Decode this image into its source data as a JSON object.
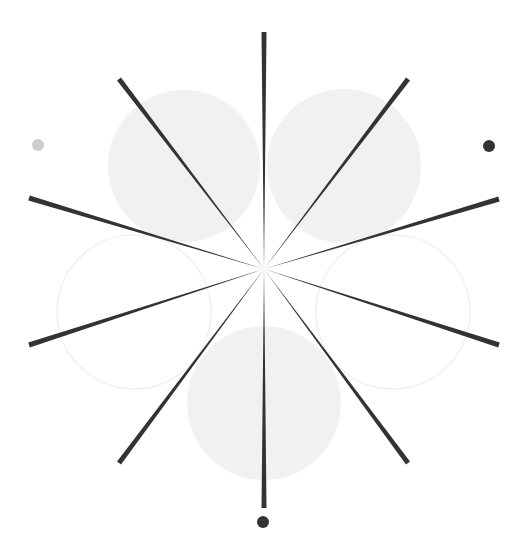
{
  "diagram": {
    "width": 529,
    "height": 551,
    "background": "#ffffff",
    "center": {
      "x": 264,
      "y": 269
    },
    "colors": {
      "spoke": "#333333",
      "filled_circle": "#f1f1f1",
      "outline_circle_stroke": "#ececec",
      "dark_dot": "#333333",
      "light_dot": "#cccccc"
    },
    "spoke_tip_width": 5,
    "spokes": [
      {
        "name": "spoke-top",
        "x": 264,
        "y": 32
      },
      {
        "name": "spoke-upper-right",
        "x": 408,
        "y": 79
      },
      {
        "name": "spoke-right-upper",
        "x": 499,
        "y": 199
      },
      {
        "name": "spoke-right-lower",
        "x": 499,
        "y": 345
      },
      {
        "name": "spoke-lower-right",
        "x": 408,
        "y": 463
      },
      {
        "name": "spoke-bottom",
        "x": 264,
        "y": 508
      },
      {
        "name": "spoke-lower-left",
        "x": 119,
        "y": 463
      },
      {
        "name": "spoke-left-lower",
        "x": 29,
        "y": 345
      },
      {
        "name": "spoke-left-upper",
        "x": 29,
        "y": 198
      },
      {
        "name": "spoke-upper-left",
        "x": 119,
        "y": 79
      }
    ],
    "circles": [
      {
        "name": "circle-upper-left",
        "cx": 184,
        "cy": 166,
        "r": 76,
        "style": "filled"
      },
      {
        "name": "circle-upper-right",
        "cx": 344,
        "cy": 166,
        "r": 77,
        "style": "filled"
      },
      {
        "name": "circle-bottom",
        "cx": 264,
        "cy": 403,
        "r": 77,
        "style": "filled"
      },
      {
        "name": "circle-left",
        "cx": 134,
        "cy": 312,
        "r": 77,
        "style": "outline"
      },
      {
        "name": "circle-right",
        "cx": 393,
        "cy": 312,
        "r": 77,
        "style": "outline"
      }
    ],
    "dots": [
      {
        "name": "dot-left",
        "cx": 38,
        "cy": 145,
        "r": 6,
        "tone": "light"
      },
      {
        "name": "dot-right",
        "cx": 489,
        "cy": 146,
        "r": 6,
        "tone": "dark"
      },
      {
        "name": "dot-bottom",
        "cx": 263,
        "cy": 522,
        "r": 6,
        "tone": "dark"
      }
    ]
  }
}
